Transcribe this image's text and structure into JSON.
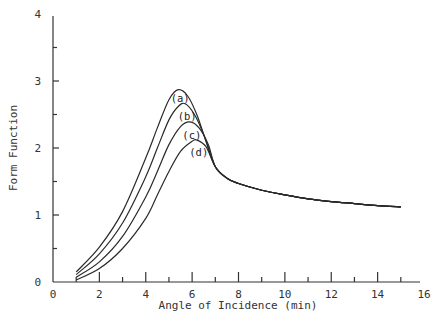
{
  "chart_data": {
    "type": "line",
    "title": "",
    "xlabel": "Angle of Incidence (min)",
    "ylabel": "Form Function",
    "xlim": [
      0,
      16
    ],
    "ylim": [
      0,
      4
    ],
    "xticks": [
      0,
      2,
      4,
      6,
      8,
      10,
      12,
      14,
      16
    ],
    "yticks": [
      0,
      1,
      2,
      3,
      4
    ],
    "grid": false,
    "legend": "inline labels",
    "series": [
      {
        "name": "(a)",
        "x": [
          1,
          2,
          3,
          4,
          4.5,
          5,
          5.4,
          5.8,
          6.2,
          6.6,
          7,
          7.5,
          8,
          9,
          10,
          11,
          12,
          13,
          14,
          15
        ],
        "y": [
          0.15,
          0.52,
          1.05,
          1.85,
          2.3,
          2.72,
          2.87,
          2.78,
          2.5,
          2.1,
          1.72,
          1.55,
          1.47,
          1.37,
          1.3,
          1.24,
          1.2,
          1.17,
          1.14,
          1.12
        ]
      },
      {
        "name": "(b)",
        "x": [
          1,
          2,
          3,
          4,
          4.5,
          5,
          5.4,
          5.7,
          6.1,
          6.5,
          7,
          7.5,
          8,
          9,
          10,
          11,
          12,
          13,
          14,
          15
        ],
        "y": [
          0.11,
          0.42,
          0.88,
          1.57,
          2.0,
          2.42,
          2.62,
          2.66,
          2.5,
          2.2,
          1.72,
          1.55,
          1.47,
          1.37,
          1.3,
          1.24,
          1.2,
          1.17,
          1.14,
          1.12
        ]
      },
      {
        "name": "(c)",
        "x": [
          1,
          2,
          3,
          4,
          4.5,
          5,
          5.5,
          5.9,
          6.3,
          6.7,
          7,
          7.5,
          8,
          9,
          10,
          11,
          12,
          13,
          14,
          15
        ],
        "y": [
          0.07,
          0.3,
          0.68,
          1.27,
          1.65,
          2.05,
          2.32,
          2.39,
          2.3,
          2.05,
          1.72,
          1.55,
          1.47,
          1.37,
          1.3,
          1.24,
          1.2,
          1.17,
          1.14,
          1.12
        ]
      },
      {
        "name": "(d)",
        "x": [
          1,
          2,
          3,
          4,
          4.5,
          5,
          5.5,
          6,
          6.2,
          6.6,
          7,
          7.5,
          8,
          9,
          10,
          11,
          12,
          13,
          14,
          15
        ],
        "y": [
          0.03,
          0.2,
          0.5,
          0.95,
          1.3,
          1.65,
          1.95,
          2.1,
          2.12,
          2.02,
          1.72,
          1.55,
          1.47,
          1.37,
          1.3,
          1.24,
          1.2,
          1.17,
          1.14,
          1.12
        ]
      }
    ],
    "annotations": [
      {
        "text": "(a)",
        "x": 5.4,
        "y": 2.75
      },
      {
        "text": "(b)",
        "x": 5.7,
        "y": 2.48
      },
      {
        "text": "(c)",
        "x": 5.9,
        "y": 2.2
      },
      {
        "text": "(d)",
        "x": 6.2,
        "y": 1.94
      }
    ]
  }
}
